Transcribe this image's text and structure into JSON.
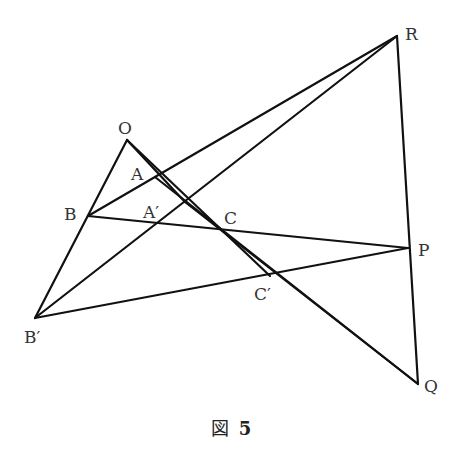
{
  "figure": {
    "caption_prefix": "図",
    "caption_number": "5",
    "points": {
      "O": {
        "label": "O",
        "x": 127,
        "y": 140
      },
      "A": {
        "label": "A",
        "x": 155,
        "y": 177
      },
      "A_prime": {
        "label": "A′",
        "x": 185,
        "y": 202
      },
      "B": {
        "label": "B",
        "x": 88,
        "y": 216
      },
      "B_prime": {
        "label": "B′",
        "x": 35,
        "y": 318
      },
      "C": {
        "label": "C",
        "x": 218,
        "y": 231
      },
      "C_prime": {
        "label": "C′",
        "x": 270,
        "y": 276
      },
      "P": {
        "label": "P",
        "x": 408,
        "y": 248
      },
      "Q": {
        "label": "Q",
        "x": 418,
        "y": 384
      },
      "R": {
        "label": "R",
        "x": 397,
        "y": 36
      }
    },
    "segments": [
      [
        "O",
        "B_prime"
      ],
      [
        "O",
        "A_prime"
      ],
      [
        "O",
        "C_prime"
      ],
      [
        "B",
        "R"
      ],
      [
        "B_prime",
        "R"
      ],
      [
        "B",
        "P"
      ],
      [
        "B_prime",
        "P"
      ],
      [
        "A",
        "Q"
      ],
      [
        "A_prime",
        "Q"
      ],
      [
        "R",
        "Q"
      ]
    ]
  }
}
